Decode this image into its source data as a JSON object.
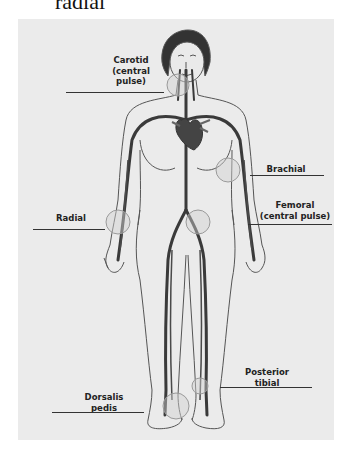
{
  "heading": {
    "text": "radial"
  },
  "diagram": {
    "colors": {
      "background": "#ebebeb",
      "artery": "#3a3a3a",
      "outline": "#555555",
      "pulse_circle_fill": "#d0d0d0",
      "pulse_circle_stroke": "#9a9a9a",
      "label": "#222222"
    },
    "labels": {
      "carotid": {
        "line1": "Carotid",
        "line2": "(central",
        "line3": "pulse)"
      },
      "brachial": {
        "line1": "Brachial"
      },
      "radial": {
        "line1": "Radial"
      },
      "femoral": {
        "line1": "Femoral",
        "line2": "(central pulse)"
      },
      "posterior_tibial": {
        "line1": "Posterior",
        "line2": "tibial"
      },
      "dorsalis_pedis": {
        "line1": "Dorsalis",
        "line2": "pedis"
      }
    }
  }
}
